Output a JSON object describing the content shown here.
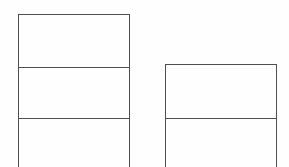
{
  "canvas": {
    "width": 289,
    "height": 167,
    "background_color": "#fefefe",
    "line_color": "#4f4f4f",
    "line_width": 1.5
  },
  "diagram": {
    "type": "outlined-rectangles",
    "boxes": [
      {
        "id": "box-1",
        "name": "left-box",
        "x": 18,
        "y": 14,
        "width": 112,
        "height": 153,
        "clipped_bottom": true,
        "rows": [
          {
            "id": "box-1-row-1",
            "height": 53,
            "text": ""
          },
          {
            "id": "box-1-row-2",
            "height": 51,
            "text": ""
          },
          {
            "id": "box-1-row-3",
            "height": 49,
            "text": ""
          }
        ]
      },
      {
        "id": "box-2",
        "name": "right-box",
        "x": 165,
        "y": 64,
        "width": 112,
        "height": 103,
        "clipped_bottom": true,
        "rows": [
          {
            "id": "box-2-row-1",
            "height": 54,
            "text": ""
          },
          {
            "id": "box-2-row-2",
            "height": 49,
            "text": ""
          }
        ]
      }
    ]
  }
}
